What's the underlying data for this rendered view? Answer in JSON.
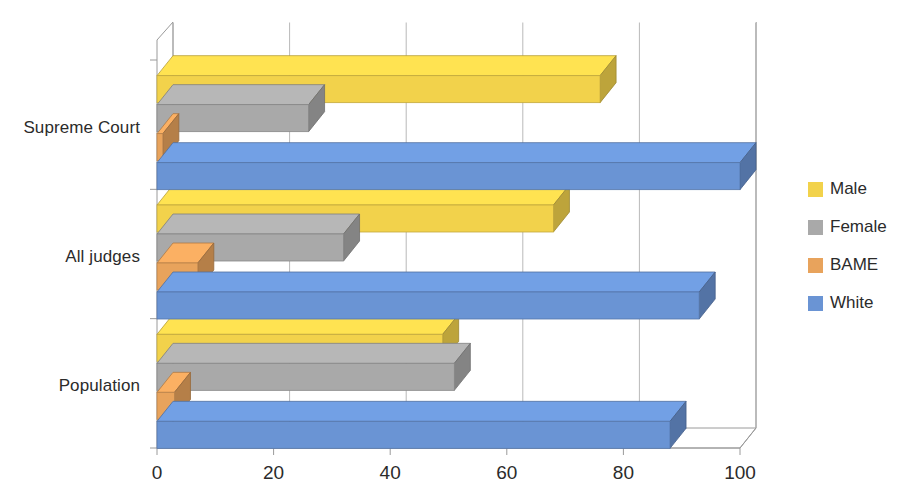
{
  "chart_data": {
    "type": "bar",
    "orientation": "horizontal",
    "title": "",
    "subtitle": "",
    "xlabel": "",
    "ylabel": "",
    "xlim": [
      0,
      100
    ],
    "xticks": [
      0,
      20,
      40,
      60,
      80,
      100
    ],
    "xtick_labels": [
      "0",
      "20",
      "40",
      "60",
      "80",
      "100"
    ],
    "grid": true,
    "grid_axis": "x",
    "legend_position": "right",
    "style_3d": true,
    "categories": [
      "Population",
      "All judges",
      "Supreme Court"
    ],
    "series": [
      {
        "name": "Male",
        "color": "#f2d24b",
        "values": [
          49,
          68,
          76
        ]
      },
      {
        "name": "Female",
        "color": "#a9a9a9",
        "values": [
          51,
          32,
          26
        ]
      },
      {
        "name": "BAME",
        "color": "#e8a35c",
        "values": [
          3,
          7,
          1
        ]
      },
      {
        "name": "White",
        "color": "#6a94d4",
        "values": [
          88,
          93,
          100
        ]
      }
    ],
    "legend_entries": [
      {
        "label": "Male",
        "color": "#f2d24b"
      },
      {
        "label": "Female",
        "color": "#a9a9a9"
      },
      {
        "label": "BAME",
        "color": "#e8a35c"
      },
      {
        "label": "White",
        "color": "#6a94d4"
      }
    ]
  },
  "axis": {
    "category_labels": [
      "Supreme Court",
      "All judges",
      "Population"
    ],
    "tick_labels": [
      "0",
      "20",
      "40",
      "60",
      "80",
      "100"
    ]
  },
  "colors": {
    "male": "#f2d24b",
    "female": "#a9a9a9",
    "bame": "#e8a35c",
    "white": "#6a94d4",
    "axis_line": "#9a9a9a",
    "grid_line": "#b9b9b9",
    "text": "#2b2b2b",
    "background": "#ffffff"
  }
}
